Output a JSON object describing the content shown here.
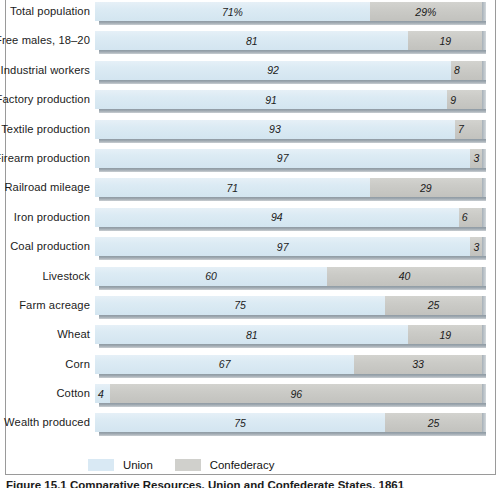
{
  "figure": {
    "caption": "Figure 15.1  Comparative Resources, Union and Confederate States, 1861",
    "legend": {
      "union_label": "Union",
      "confederacy_label": "Confederacy",
      "union_color": "#d9e9f4",
      "confederacy_color": "#d0d0cc"
    }
  },
  "chart_data": {
    "type": "bar",
    "subtype": "stacked-horizontal-100-percent",
    "title": "",
    "xlabel": "",
    "ylabel": "",
    "xlim": [
      0,
      100
    ],
    "grid": false,
    "legend_position": "bottom",
    "categories": [
      "Total population",
      "Free males, 18–20",
      "Industrial workers",
      "Factory production",
      "Textile production",
      "Firearm production",
      "Railroad mileage",
      "Iron production",
      "Coal production",
      "Livestock",
      "Farm acreage",
      "Wheat",
      "Corn",
      "Cotton",
      "Wealth produced"
    ],
    "series": [
      {
        "name": "Union",
        "color": "#d9e9f4",
        "values": [
          71,
          81,
          92,
          91,
          93,
          97,
          71,
          94,
          97,
          60,
          75,
          81,
          67,
          4,
          75
        ],
        "labels": [
          "71%",
          "81",
          "92",
          "91",
          "93",
          "97",
          "71",
          "94",
          "97",
          "60",
          "75",
          "81",
          "67",
          "4",
          "75"
        ]
      },
      {
        "name": "Confederacy",
        "color": "#d0d0cc",
        "values": [
          29,
          19,
          8,
          9,
          7,
          3,
          29,
          6,
          3,
          40,
          25,
          19,
          33,
          96,
          25
        ],
        "labels": [
          "29%",
          "19",
          "8",
          "9",
          "7",
          "3",
          "29",
          "6",
          "3",
          "40",
          "25",
          "19",
          "33",
          "96",
          "25"
        ]
      }
    ]
  }
}
